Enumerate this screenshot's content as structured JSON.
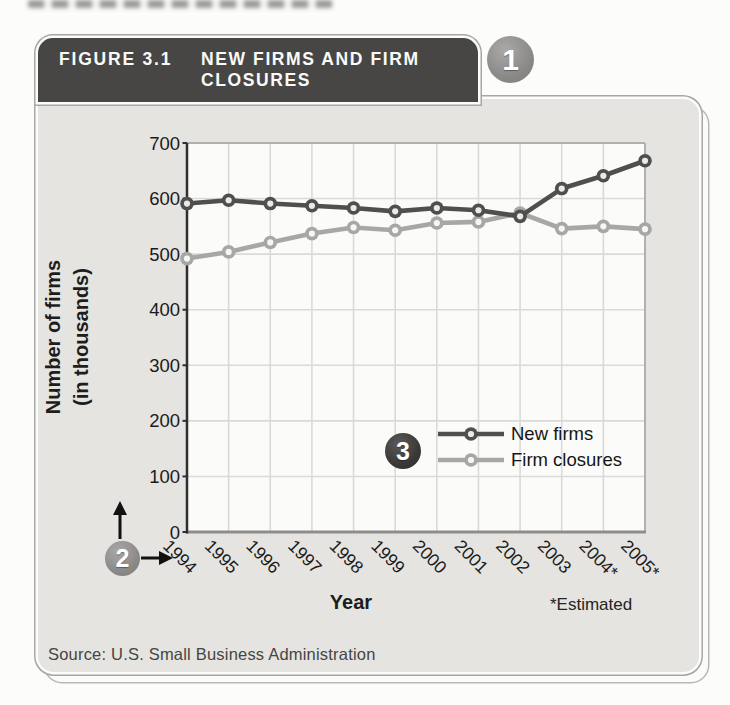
{
  "figure": {
    "label": "FIGURE 3.1",
    "title_line1": "NEW FIRMS AND FIRM",
    "title_line2": "CLOSURES",
    "source": "Source: U.S. Small Business Administration"
  },
  "callouts": {
    "header_badge": "1",
    "axes_badge": "2",
    "legend_badge": "3"
  },
  "chart_data": {
    "type": "line",
    "title": "NEW FIRMS AND FIRM CLOSURES",
    "categories": [
      "1994",
      "1995",
      "1996",
      "1997",
      "1998",
      "1999",
      "2000",
      "2001",
      "2002",
      "2003",
      "2004*",
      "2005*"
    ],
    "series": [
      {
        "name": "New firms",
        "color": "#4f4f4d",
        "marker_center": "#eaeae8",
        "values": [
          591,
          597,
          591,
          587,
          583,
          577,
          583,
          579,
          568,
          618,
          641,
          668
        ]
      },
      {
        "name": "Firm closures",
        "color": "#a7a7a5",
        "marker_center": "#f6f6f4",
        "values": [
          492,
          504,
          521,
          537,
          548,
          543,
          556,
          558,
          574,
          546,
          550,
          545
        ]
      }
    ],
    "xlabel": "Year",
    "ylabel": "Number of firms (in thousands)",
    "ylabel_line1": "Number of firms",
    "ylabel_line2": "(in thousands)",
    "note": "*Estimated",
    "ylim": [
      0,
      700
    ],
    "yticks": [
      0,
      100,
      200,
      300,
      400,
      500,
      600,
      700
    ],
    "grid": true,
    "legend_position": "inside bottom-right"
  },
  "colors": {
    "page_bg": "#fcfcfa",
    "card_bg": "#e5e4e1",
    "header_bg": "#474644",
    "plot_bg": "#fbfbfa",
    "gridline": "#dadad8",
    "left_axis": "#2f2f2d",
    "bottom_axis": "#8d8d8b",
    "plot_border": "#b0b0ae",
    "badge_gray": "#8a8987",
    "badge_dark": "#393837",
    "text": "#1b1b19"
  }
}
